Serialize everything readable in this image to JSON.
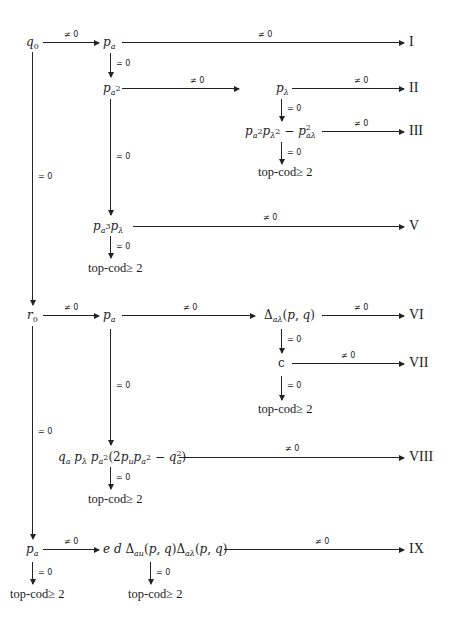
{
  "diagram": {
    "type": "decision-tree",
    "conditions": {
      "nonzero": "≠ 0",
      "zero": "= 0"
    },
    "results": [
      "I",
      "II",
      "III",
      "V",
      "VI",
      "VII",
      "VIII",
      "IX"
    ],
    "terminal_label": "top-cod≥ 2",
    "nodes": {
      "q0": "q0",
      "pa_top": "pa",
      "pa2": "pa²",
      "plambda": "pλ",
      "pa2plambda2_minus": "pa²pλ² − p²aλ",
      "pa3plambda": "pa³pλ",
      "r0": "r0",
      "pa_mid": "pa",
      "delta_alambda": "Δaλ(p, q)",
      "c": "c",
      "qa_expr": "qa pλ pa²(2pu pa² − q²a)",
      "pa_bottom": "pa",
      "edDelta": "e d Δau(p, q)Δaλ(p, q)"
    },
    "edges": [
      {
        "from": "q0",
        "to": "pa_top",
        "label": "≠ 0"
      },
      {
        "from": "pa_top",
        "to": "I",
        "label": "≠ 0"
      },
      {
        "from": "pa_top",
        "to": "pa2",
        "label": "= 0"
      },
      {
        "from": "pa2",
        "to": "plambda",
        "label": "≠ 0"
      },
      {
        "from": "plambda",
        "to": "II",
        "label": "≠ 0"
      },
      {
        "from": "plambda",
        "to": "pa2plambda2_minus",
        "label": "= 0"
      },
      {
        "from": "pa2plambda2_minus",
        "to": "III",
        "label": "≠ 0"
      },
      {
        "from": "pa2plambda2_minus",
        "to": "top-cod≥ 2",
        "label": "= 0"
      },
      {
        "from": "pa2",
        "to": "pa3plambda",
        "label": "= 0"
      },
      {
        "from": "pa3plambda",
        "to": "V",
        "label": "≠ 0"
      },
      {
        "from": "pa3plambda",
        "to": "top-cod≥ 2",
        "label": "= 0"
      },
      {
        "from": "q0",
        "to": "r0",
        "label": "= 0"
      },
      {
        "from": "r0",
        "to": "pa_mid",
        "label": "≠ 0"
      },
      {
        "from": "pa_mid",
        "to": "delta_alambda",
        "label": "≠ 0"
      },
      {
        "from": "delta_alambda",
        "to": "VI",
        "label": "≠ 0"
      },
      {
        "from": "delta_alambda",
        "to": "c",
        "label": "= 0"
      },
      {
        "from": "c",
        "to": "VII",
        "label": "≠ 0"
      },
      {
        "from": "c",
        "to": "top-cod≥ 2",
        "label": "= 0"
      },
      {
        "from": "pa_mid",
        "to": "qa_expr",
        "label": "= 0"
      },
      {
        "from": "qa_expr",
        "to": "VIII",
        "label": "≠ 0"
      },
      {
        "from": "qa_expr",
        "to": "top-cod≥ 2",
        "label": "= 0"
      },
      {
        "from": "r0",
        "to": "pa_bottom",
        "label": "= 0"
      },
      {
        "from": "pa_bottom",
        "to": "edDelta",
        "label": "≠ 0"
      },
      {
        "from": "pa_bottom",
        "to": "top-cod≥ 2",
        "label": "= 0"
      },
      {
        "from": "edDelta",
        "to": "IX",
        "label": "≠ 0"
      },
      {
        "from": "edDelta",
        "to": "top-cod≥ 2",
        "label": "= 0"
      }
    ]
  }
}
